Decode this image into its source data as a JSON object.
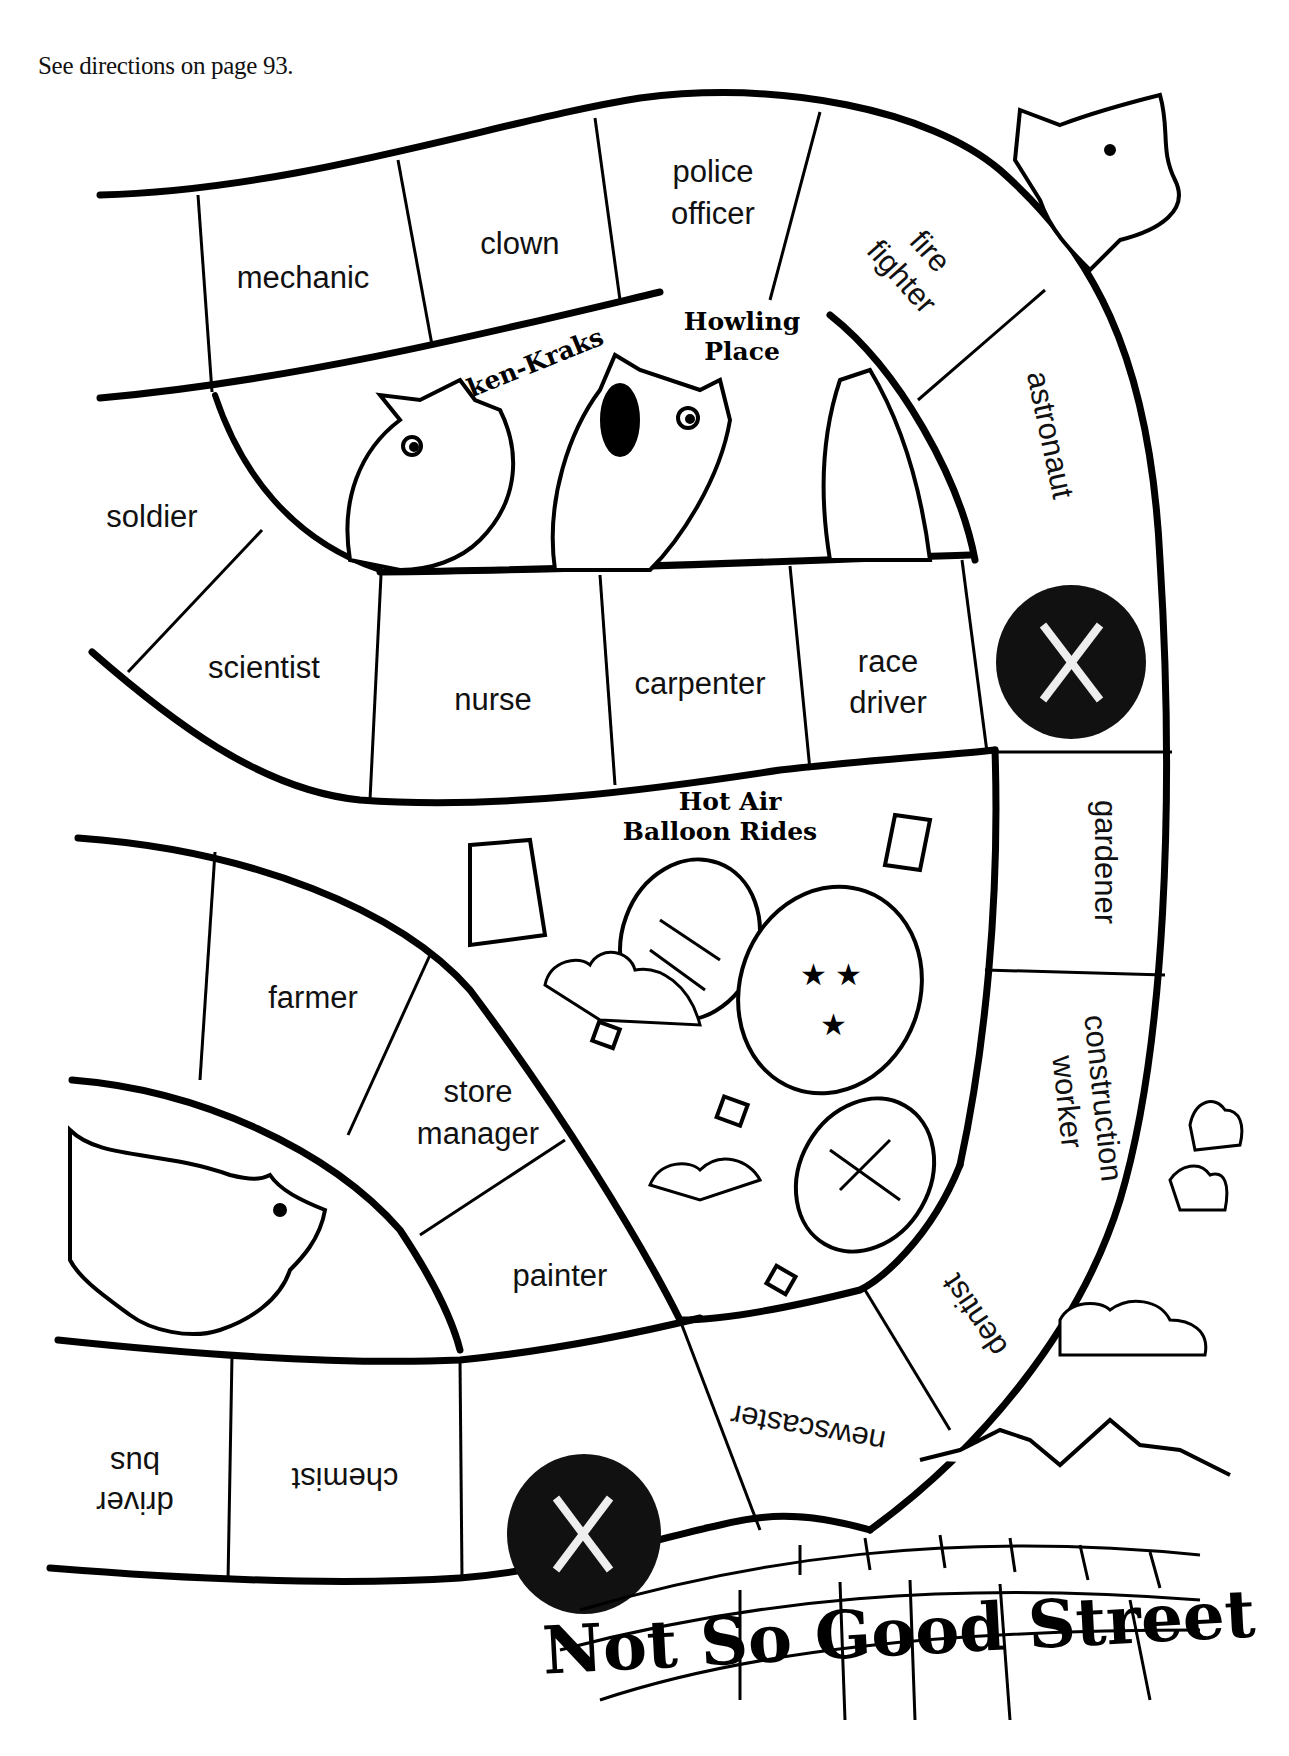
{
  "header": {
    "directions": "See directions on page 93."
  },
  "board": {
    "path_color": "#000000",
    "space_fill": "#ffffff",
    "lose_space_fill": "#111111",
    "lose_space_mark": "X",
    "spaces": [
      {
        "id": 1,
        "label_lines": [
          "mechanic"
        ]
      },
      {
        "id": 2,
        "label_lines": [
          "clown"
        ]
      },
      {
        "id": 3,
        "label_lines": [
          "police",
          "officer"
        ]
      },
      {
        "id": 4,
        "label_lines": [
          "fire",
          "fighter"
        ]
      },
      {
        "id": 5,
        "label_lines": [
          "astronaut"
        ]
      },
      {
        "id": 6,
        "label_lines": [
          "soldier"
        ]
      },
      {
        "id": 7,
        "label_lines": [
          "scientist"
        ]
      },
      {
        "id": 8,
        "label_lines": [
          "nurse"
        ]
      },
      {
        "id": 9,
        "label_lines": [
          "carpenter"
        ]
      },
      {
        "id": 10,
        "label_lines": [
          "race",
          "driver"
        ]
      },
      {
        "id": 11,
        "label_lines": [
          "X"
        ],
        "type": "lose-turn"
      },
      {
        "id": 12,
        "label_lines": [
          "gardener"
        ]
      },
      {
        "id": 13,
        "label_lines": [
          "construction",
          "worker"
        ]
      },
      {
        "id": 14,
        "label_lines": [
          "farmer"
        ]
      },
      {
        "id": 15,
        "label_lines": [
          "store",
          "manager"
        ]
      },
      {
        "id": 16,
        "label_lines": [
          "painter"
        ]
      },
      {
        "id": 17,
        "label_lines": [
          "dentist"
        ]
      },
      {
        "id": 18,
        "label_lines": [
          "newscaster"
        ]
      },
      {
        "id": 19,
        "label_lines": [
          "X"
        ],
        "type": "lose-turn"
      },
      {
        "id": 20,
        "label_lines": [
          "chemist"
        ]
      },
      {
        "id": 21,
        "label_lines": [
          "bus",
          "driver"
        ]
      }
    ]
  },
  "signs": {
    "haken_kraks": "Haken-Kraks",
    "howling_place_line1": "Howling",
    "howling_place_line2": "Place",
    "balloon_line1": "Hot  Air",
    "balloon_line2": "Balloon  Rides"
  },
  "street": {
    "name": "Not So Good Street"
  },
  "illustrations": [
    "dragon-creatures",
    "hot-air-balloons",
    "clouds",
    "beaver",
    "mountains",
    "brick-street"
  ]
}
